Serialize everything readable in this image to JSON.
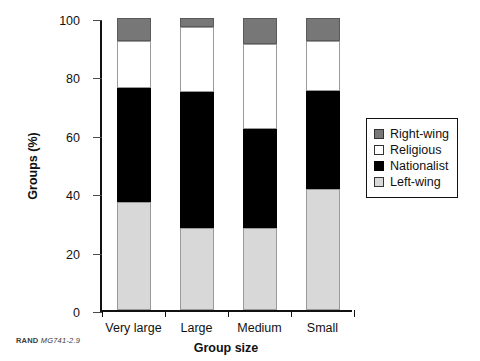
{
  "chart_data": {
    "type": "bar",
    "subtype": "stacked-percentage-column",
    "title": "",
    "xlabel": "Group size",
    "ylabel": "Groups (%)",
    "categories": [
      "Very large",
      "Large",
      "Medium",
      "Small"
    ],
    "ylim": [
      0,
      100
    ],
    "yticks": [
      0,
      20,
      40,
      60,
      80,
      100
    ],
    "ytick_labels": [
      "0",
      "20",
      "40",
      "60",
      "80",
      "100"
    ],
    "grid": false,
    "legend_position": "right",
    "stack_order_bottom_to_top": [
      "Left-wing",
      "Nationalist",
      "Religious",
      "Right-wing"
    ],
    "series": [
      {
        "name": "Left-wing",
        "color": "#d8d8d8",
        "values": [
          37,
          28,
          28,
          41.5
        ]
      },
      {
        "name": "Nationalist",
        "color": "#000000",
        "values": [
          39,
          46.5,
          34,
          33.5
        ]
      },
      {
        "name": "Religious",
        "color": "#ffffff",
        "values": [
          16,
          22.5,
          29,
          17
        ]
      },
      {
        "name": "Right-wing",
        "color": "#777777",
        "values": [
          8,
          3,
          9,
          8
        ]
      }
    ],
    "cumulative_tops": {
      "Left-wing": [
        37,
        28,
        28,
        41.5
      ],
      "Nationalist": [
        76,
        74.5,
        62,
        75
      ],
      "Religious": [
        92,
        97,
        91,
        92
      ],
      "Right-wing": [
        100,
        100,
        100,
        100
      ]
    }
  },
  "legend": {
    "items": [
      {
        "label": "Right-wing",
        "swatch": "gray-swatch"
      },
      {
        "label": "Religious",
        "swatch": "white-swatch"
      },
      {
        "label": "Nationalist",
        "swatch": "black-swatch"
      },
      {
        "label": "Left-wing",
        "swatch": "light-gray-swatch"
      }
    ]
  },
  "footer": {
    "source": "RAND",
    "document_code": "MG741-2.9"
  }
}
